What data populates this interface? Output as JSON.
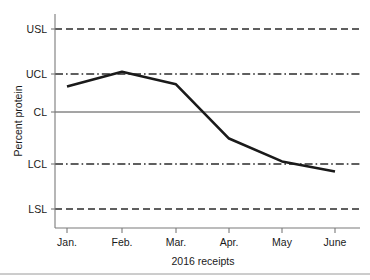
{
  "chart_data": {
    "type": "line",
    "title": "",
    "subtitle": "",
    "xlabel": "2016 receipts",
    "ylabel": "Percent protein",
    "categories": [
      "Jan.",
      "Feb.",
      "Mar.",
      "Apr.",
      "May",
      "June"
    ],
    "series": [
      {
        "name": "Percent protein",
        "values": [
          1.52,
          2.68,
          1.7,
          -2.52,
          -4.3,
          -5.08
        ]
      }
    ],
    "ylim": [
      -8,
      8
    ],
    "ytick_labels": [
      "USL",
      "UCL",
      "CL",
      "LCL",
      "LSL"
    ],
    "ytick_values": [
      6,
      2,
      0,
      -4,
      -8
    ],
    "grid": false,
    "legend": "none",
    "reference_lines": [
      {
        "label": "USL",
        "value": 6,
        "style": "dashed",
        "name": "upper-spec-limit"
      },
      {
        "label": "UCL",
        "value": 2,
        "style": "dash-dot",
        "name": "upper-control-limit"
      },
      {
        "label": "CL",
        "value": 0,
        "style": "solid",
        "name": "center-line"
      },
      {
        "label": "LCL",
        "value": -4,
        "style": "dash-dot",
        "name": "lower-control-limit"
      },
      {
        "label": "LSL",
        "value": -8,
        "style": "dashed",
        "name": "lower-spec-limit"
      }
    ],
    "colors": {
      "series": "#1a1a1a",
      "limits": "#2b2b2b",
      "center": "#4a4a4a",
      "axis": "#7a7a7a",
      "background": "#ffffff"
    }
  }
}
